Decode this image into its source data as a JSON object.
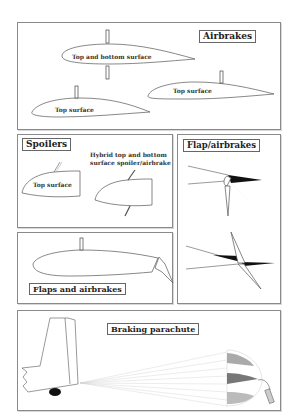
{
  "header_fragment": "",
  "panels": {
    "airbrakes": {
      "title": "Airbrakes",
      "labels": [
        "Top and bottom surface",
        "Top surface",
        "Top surface"
      ]
    },
    "spoilers": {
      "title": "Spoilers",
      "labels": [
        "Top surface",
        "Hybrid top and bottom",
        "surface spoiler/airbrake"
      ]
    },
    "flap_airbrakes": {
      "title": "Flap/airbrakes"
    },
    "flaps_and_airbrakes": {
      "title": "Flaps and airbrakes"
    },
    "braking_parachute": {
      "title": "Braking parachute"
    }
  },
  "colors": {
    "border": "#8a8a8a",
    "dark_fill": "#111111",
    "mid_grey": "#9a9a9a",
    "light_grey": "#cfcfcf"
  }
}
